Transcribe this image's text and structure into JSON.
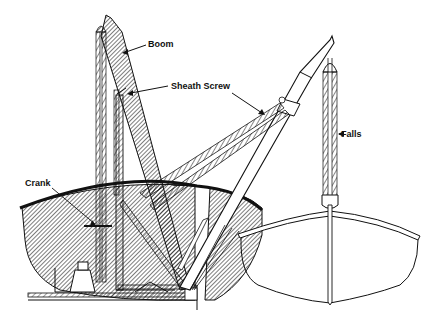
{
  "figure": {
    "colors": {
      "ink": "#111111",
      "background": "#ffffff"
    },
    "labels": [
      {
        "id": "boom",
        "text": "Boom"
      },
      {
        "id": "sheath_screw",
        "text": "Sheath Screw"
      },
      {
        "id": "falls",
        "text": "Falls"
      },
      {
        "id": "crank",
        "text": "Crank"
      }
    ]
  }
}
